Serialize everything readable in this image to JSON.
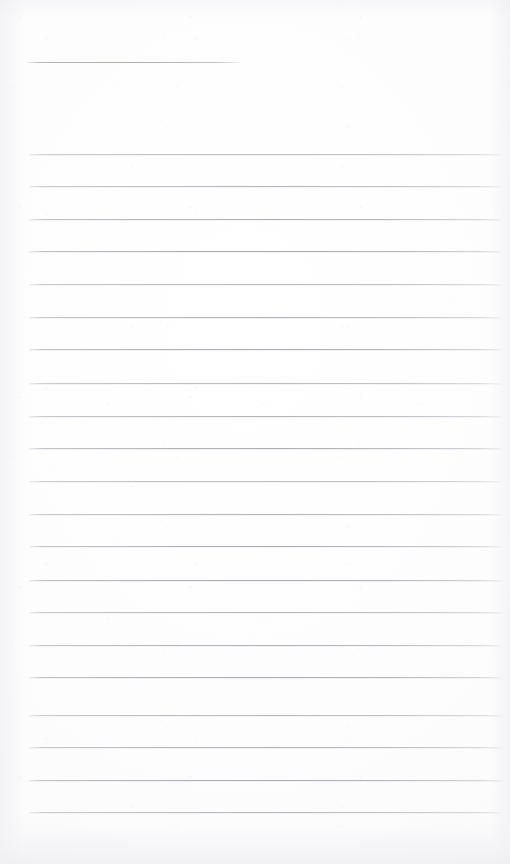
{
  "document": {
    "kind": "scanned-blank-ruled-notepaper",
    "page_width": 510,
    "page_height": 864,
    "paper_color": "#fcfcfd",
    "rule_color": "#aaaab3",
    "has_text": false,
    "text_content": "",
    "heading_rule": {
      "name": "title-rule",
      "y": 62,
      "x_start": 27,
      "x_end": 240,
      "thickness": 1,
      "color": "#a8a8b1"
    },
    "body_rules": {
      "count": 21,
      "x_start": 29,
      "x_end": 501,
      "thickness": 1,
      "color": "#a6a6af",
      "spacing": 32.9,
      "y_positions": [
        154,
        186,
        219,
        251,
        284,
        317,
        349,
        383,
        416,
        448,
        481,
        514,
        546,
        580,
        612,
        645,
        677,
        715,
        747,
        780,
        812
      ]
    },
    "blank_regions": [
      {
        "name": "top-margin",
        "y_start": 0,
        "y_end": 55
      },
      {
        "name": "header-gap",
        "y_start": 68,
        "y_end": 150
      },
      {
        "name": "bottom-margin",
        "y_start": 820,
        "y_end": 864
      }
    ]
  }
}
